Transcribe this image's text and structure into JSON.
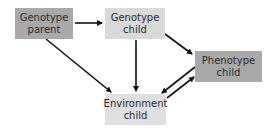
{
  "diagram": {
    "nodes": [
      {
        "id": "genotype_parent",
        "label": "Genotype\nparent",
        "fill": "#a9a9a9"
      },
      {
        "id": "genotype_child",
        "label": "Genotype\nchild",
        "fill": "#d9d9d9"
      },
      {
        "id": "phenotype_child",
        "label": "Phenotype\nchild",
        "fill": "#a9a9a9"
      },
      {
        "id": "environment_child",
        "label": "Environment\nchild",
        "fill": "#e0e0e0"
      }
    ],
    "edges": [
      {
        "from": "genotype_parent",
        "to": "genotype_child"
      },
      {
        "from": "genotype_parent",
        "to": "environment_child"
      },
      {
        "from": "genotype_child",
        "to": "environment_child"
      },
      {
        "from": "genotype_child",
        "to": "phenotype_child"
      },
      {
        "from": "phenotype_child",
        "to": "environment_child"
      },
      {
        "from": "environment_child",
        "to": "phenotype_child"
      }
    ],
    "edge_color": "#111111"
  }
}
